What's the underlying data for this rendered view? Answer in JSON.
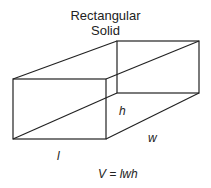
{
  "diagram": {
    "title_line1": "Rectangular",
    "title_line2": "Solid",
    "labels": {
      "height": "h",
      "width": "w",
      "length": "l"
    },
    "formula": "V = lwh",
    "stroke_color": "#222222"
  }
}
